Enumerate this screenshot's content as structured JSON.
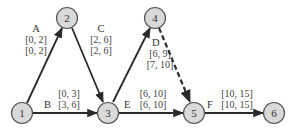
{
  "diagram": {
    "type": "activity-on-arrow network",
    "nodes": [
      {
        "id": "1",
        "label": "1",
        "x": 22,
        "y": 112
      },
      {
        "id": "2",
        "label": "2",
        "x": 67,
        "y": 18
      },
      {
        "id": "3",
        "label": "3",
        "x": 108,
        "y": 112
      },
      {
        "id": "4",
        "label": "4",
        "x": 155,
        "y": 18
      },
      {
        "id": "5",
        "label": "5",
        "x": 194,
        "y": 112
      },
      {
        "id": "6",
        "label": "6",
        "x": 274,
        "y": 112
      }
    ],
    "activities": [
      {
        "name": "A",
        "from": "1",
        "to": "2",
        "early": "[0, 2]",
        "late": "[0, 2]",
        "dashed": false
      },
      {
        "name": "B",
        "from": "1",
        "to": "3",
        "early": "[0, 3]",
        "late": "[3, 6]",
        "dashed": false
      },
      {
        "name": "C",
        "from": "2",
        "to": "3",
        "early": "[2, 6]",
        "late": "[2, 6]",
        "dashed": false
      },
      {
        "name": "D",
        "from": "3",
        "to": "4",
        "early": "[6, 9]",
        "late": "[7, 10]",
        "dashed": false
      },
      {
        "name": "",
        "from": "4",
        "to": "5",
        "early": "",
        "late": "",
        "dashed": true
      },
      {
        "name": "E",
        "from": "3",
        "to": "5",
        "early": "[6, 10]",
        "late": "[6, 10]",
        "dashed": false
      },
      {
        "name": "F",
        "from": "5",
        "to": "6",
        "early": "[10, 15]",
        "late": "[10, 15]",
        "dashed": false
      }
    ]
  }
}
